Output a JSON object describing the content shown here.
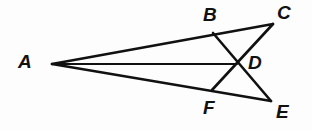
{
  "figure": {
    "kind": "geometry-diagram",
    "background_color": "#fdfdfd",
    "stroke_color": "#111111",
    "label_color": "#111111",
    "width": 312,
    "height": 131,
    "points": {
      "A": {
        "name": "A",
        "x": 52,
        "y": 64
      },
      "B": {
        "name": "B",
        "x": 213,
        "y": 33
      },
      "C": {
        "name": "C",
        "x": 273,
        "y": 24
      },
      "D": {
        "name": "D",
        "x": 237,
        "y": 64
      },
      "E": {
        "name": "E",
        "x": 271,
        "y": 101
      },
      "F": {
        "name": "F",
        "x": 212,
        "y": 90
      }
    },
    "labels": [
      {
        "id": "label-a",
        "text": "A",
        "x": 18,
        "y": 52
      },
      {
        "id": "label-b",
        "text": "B",
        "x": 203,
        "y": 5
      },
      {
        "id": "label-c",
        "text": "C",
        "x": 277,
        "y": 3
      },
      {
        "id": "label-d",
        "text": "D",
        "x": 248,
        "y": 53
      },
      {
        "id": "label-e",
        "text": "E",
        "x": 276,
        "y": 102
      },
      {
        "id": "label-f",
        "text": "F",
        "x": 203,
        "y": 98
      }
    ],
    "edges": [
      {
        "id": "edge-ac",
        "from": "A",
        "to": "C",
        "d": "M 52 64 L 273 24",
        "width": 2.6
      },
      {
        "id": "edge-ad",
        "from": "A",
        "to": "D",
        "d": "M 52 64 L 237 64",
        "width": 2.0
      },
      {
        "id": "edge-ae",
        "from": "A",
        "to": "E",
        "d": "M 52 64 L 271 101",
        "width": 2.6
      },
      {
        "id": "edge-be",
        "from": "B",
        "to": "E",
        "d": "M 213 33 L 271 101",
        "width": 2.6
      },
      {
        "id": "edge-fc",
        "from": "F",
        "to": "C",
        "d": "M 212 90 L 273 24",
        "width": 2.6
      }
    ]
  }
}
